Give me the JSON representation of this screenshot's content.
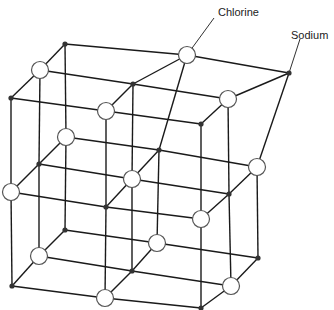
{
  "diagram": {
    "labels": {
      "chlorine": "Chlorine",
      "sodium": "Sodium"
    },
    "legend": {
      "chlorine_symbol": "open-circle",
      "sodium_symbol": "small-filled-dot"
    },
    "colors": {
      "line": "#1a1a1a",
      "sodium_fill": "#333333",
      "chlorine_fill": "#ffffff",
      "chlorine_stroke": "#555555",
      "background": "#ffffff"
    },
    "lattice": {
      "size": "3x3x3",
      "note": "alternating sodium and chlorine ions",
      "layers": [
        {
          "name": "front",
          "rows": [
            [
              {
                "x": 11,
                "y": 98,
                "ion": "sodium"
              },
              {
                "x": 106,
                "y": 111,
                "ion": "chlorine"
              },
              {
                "x": 201,
                "y": 124,
                "ion": "sodium"
              }
            ],
            [
              {
                "x": 11,
                "y": 192,
                "ion": "chlorine"
              },
              {
                "x": 106,
                "y": 207,
                "ion": "sodium"
              },
              {
                "x": 201,
                "y": 219,
                "ion": "chlorine"
              }
            ],
            [
              {
                "x": 12,
                "y": 286,
                "ion": "sodium"
              },
              {
                "x": 105,
                "y": 298,
                "ion": "chlorine"
              },
              {
                "x": 201,
                "y": 308,
                "ion": "sodium"
              }
            ]
          ]
        },
        {
          "name": "middle",
          "rows": [
            [
              {
                "x": 40,
                "y": 70,
                "ion": "chlorine"
              },
              {
                "x": 133,
                "y": 84,
                "ion": "sodium"
              },
              {
                "x": 228,
                "y": 99,
                "ion": "chlorine"
              }
            ],
            [
              {
                "x": 39,
                "y": 164,
                "ion": "sodium"
              },
              {
                "x": 132,
                "y": 179,
                "ion": "chlorine"
              },
              {
                "x": 229,
                "y": 194,
                "ion": "sodium"
              }
            ],
            [
              {
                "x": 39,
                "y": 256,
                "ion": "chlorine"
              },
              {
                "x": 132,
                "y": 271,
                "ion": "sodium"
              },
              {
                "x": 231,
                "y": 286,
                "ion": "chlorine"
              }
            ]
          ]
        },
        {
          "name": "back",
          "rows": [
            [
              {
                "x": 65,
                "y": 44,
                "ion": "sodium"
              },
              {
                "x": 187,
                "y": 55,
                "ion": "chlorine"
              },
              {
                "x": 289,
                "y": 73,
                "ion": "sodium"
              }
            ],
            [
              {
                "x": 66,
                "y": 137,
                "ion": "chlorine"
              },
              {
                "x": 159,
                "y": 150,
                "ion": "sodium"
              },
              {
                "x": 257,
                "y": 167,
                "ion": "chlorine"
              }
            ],
            [
              {
                "x": 65,
                "y": 230,
                "ion": "sodium"
              },
              {
                "x": 157,
                "y": 243,
                "ion": "chlorine"
              },
              {
                "x": 258,
                "y": 258,
                "ion": "sodium"
              }
            ]
          ]
        }
      ]
    },
    "callouts": [
      {
        "label_key": "chlorine",
        "from": {
          "x": 187,
          "y": 55
        },
        "to": {
          "x": 214,
          "y": 18
        },
        "text_x": 218,
        "text_y": 6
      },
      {
        "label_key": "sodium",
        "from": {
          "x": 289,
          "y": 73
        },
        "to": {
          "x": 300,
          "y": 39
        },
        "text_x": 291,
        "text_y": 29
      }
    ]
  }
}
